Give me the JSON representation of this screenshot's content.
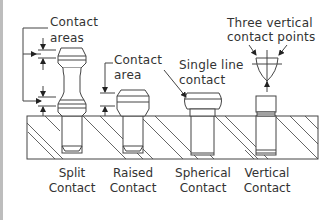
{
  "diagram": {
    "callouts": {
      "contact_areas_line1": "Contact",
      "contact_areas_line2": "areas",
      "contact_area_line1": "Contact",
      "contact_area_line2": "area",
      "single_line_line1": "Single line",
      "single_line_line2": "contact",
      "three_points_line1": "Three vertical",
      "three_points_line2": "contact points"
    },
    "captions": [
      {
        "line1": "Split",
        "line2": "Contact"
      },
      {
        "line1": "Raised",
        "line2": "Contact"
      },
      {
        "line1": "Spherical",
        "line2": "Contact"
      },
      {
        "line1": "Vertical",
        "line2": "Contact"
      }
    ],
    "colors": {
      "line": "#444444",
      "text": "#333333",
      "left_bar": "#bdbdbd",
      "background": "#ffffff"
    }
  }
}
